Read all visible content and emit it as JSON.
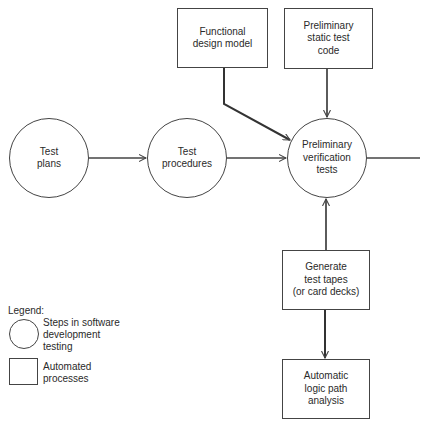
{
  "diagram": {
    "nodes": {
      "test_plans": {
        "label_lines": [
          "Test",
          "plans"
        ],
        "shape": "circle"
      },
      "test_procedures": {
        "label_lines": [
          "Test",
          "procedures"
        ],
        "shape": "circle"
      },
      "preliminary_verification_tests": {
        "label_lines": [
          "Preliminary",
          "verification",
          "tests"
        ],
        "shape": "circle"
      },
      "functional_design_model": {
        "label_lines": [
          "Functional",
          "design model"
        ],
        "shape": "box"
      },
      "preliminary_static_test_code": {
        "label_lines": [
          "Preliminary",
          "static test",
          "code"
        ],
        "shape": "box"
      },
      "generate_test_tapes": {
        "label_lines": [
          "Generate",
          "test tapes",
          "(or card decks)"
        ],
        "shape": "box"
      },
      "automatic_logic_path_analysis": {
        "label_lines": [
          "Automatic",
          "logic path",
          "analysis"
        ],
        "shape": "box"
      }
    },
    "edges": [
      {
        "from": "Test plans",
        "to": "Test procedures"
      },
      {
        "from": "Test procedures",
        "to": "Preliminary verification tests"
      },
      {
        "from": "Functional design model",
        "to": "Preliminary verification tests"
      },
      {
        "from": "Preliminary static test code",
        "to": "Preliminary verification tests"
      },
      {
        "from": "Generate test tapes (or card decks)",
        "to": "Preliminary verification tests"
      },
      {
        "from": "Generate test tapes (or card decks)",
        "to": "Automatic logic path analysis"
      },
      {
        "from": "Preliminary verification tests",
        "to": "(continues off right edge)"
      }
    ],
    "legend": {
      "title": "Legend:",
      "items": [
        {
          "symbol": "circle",
          "label_lines": [
            "Steps in software",
            "development",
            "testing"
          ]
        },
        {
          "symbol": "box",
          "label_lines": [
            "Automated",
            "processes"
          ]
        }
      ]
    },
    "colors": {
      "line": "#444444",
      "text": "#2a2a2a",
      "background": "#ffffff"
    }
  }
}
